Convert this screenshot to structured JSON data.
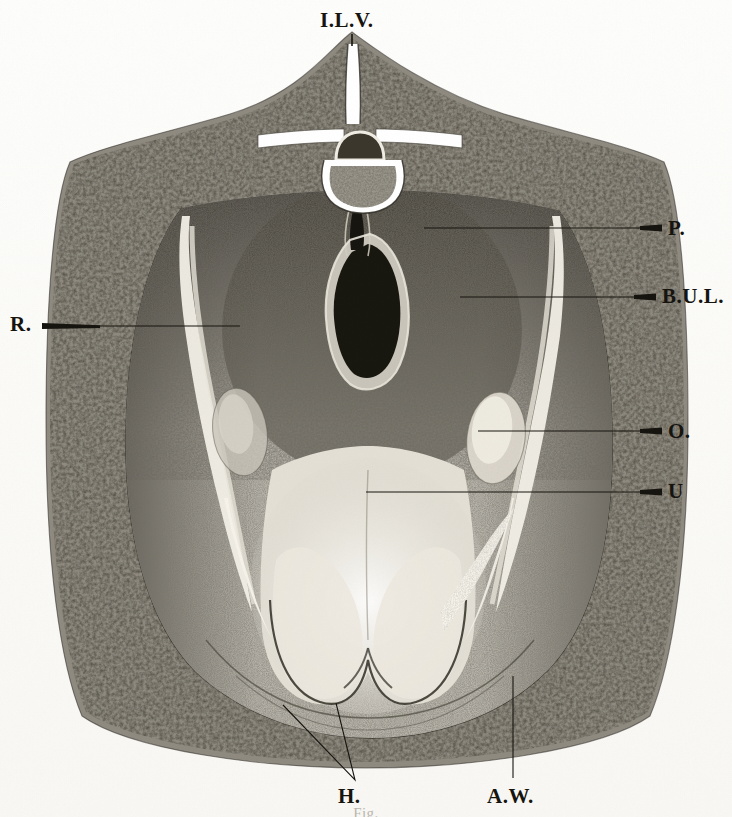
{
  "plate": {
    "title": "Transverse section of the female pelvis",
    "medium": "engraved halftone anatomical plate",
    "background_color": "#fdfdfb",
    "ink_color": "#16140f"
  },
  "labels": [
    {
      "key": "ILV",
      "text": "I.L.V.",
      "name": "label-ilv",
      "meaning": "intervertebral / lumbar vertebra",
      "x": 320,
      "y": 8,
      "size": "lg",
      "leader": {
        "type": "vertical",
        "x1": 352,
        "y1": 34,
        "x2": 352,
        "y2": 44
      }
    },
    {
      "key": "P",
      "text": "P.",
      "name": "label-p",
      "meaning": "peritoneum",
      "x": 668,
      "y": 216,
      "size": "lg",
      "leader": {
        "type": "horizontal",
        "x1": 424,
        "y1": 228,
        "x2": 662,
        "y2": 228
      }
    },
    {
      "key": "BUL",
      "text": "B.U.L.",
      "name": "label-bul",
      "meaning": "broad uterine ligament",
      "x": 662,
      "y": 284,
      "size": "lg",
      "leader": {
        "type": "horizontal",
        "x1": 460,
        "y1": 297,
        "x2": 656,
        "y2": 297
      }
    },
    {
      "key": "O",
      "text": "O.",
      "name": "label-o",
      "meaning": "ovary",
      "x": 668,
      "y": 419,
      "size": "lg",
      "leader": {
        "type": "horizontal",
        "x1": 478,
        "y1": 431,
        "x2": 662,
        "y2": 431
      }
    },
    {
      "key": "U",
      "text": "U",
      "name": "label-u",
      "meaning": "uterus",
      "x": 668,
      "y": 479,
      "size": "lg",
      "leader": {
        "type": "horizontal",
        "x1": 366,
        "y1": 492,
        "x2": 662,
        "y2": 492
      }
    },
    {
      "key": "R",
      "text": "R.",
      "name": "label-r",
      "meaning": "rectum",
      "x": 10,
      "y": 312,
      "size": "lg",
      "leader": {
        "type": "horizontal",
        "x1": 42,
        "y1": 326,
        "x2": 238,
        "y2": 326
      }
    },
    {
      "key": "H",
      "text": "H.",
      "name": "label-h",
      "meaning": "hip / head of femur",
      "x": 338,
      "y": 784,
      "size": "lg",
      "leader": {
        "type": "fork",
        "apex_x": 355,
        "apex_y": 780,
        "left_x": 283,
        "left_y": 705,
        "right_x": 336,
        "right_y": 703
      }
    },
    {
      "key": "AW",
      "text": "A.W.",
      "name": "label-aw",
      "meaning": "abdominal wall",
      "x": 487,
      "y": 784,
      "size": "lg",
      "leader": {
        "type": "vertical",
        "x1": 513,
        "y1": 676,
        "x2": 513,
        "y2": 778
      }
    }
  ],
  "caption_cut_off": "Fig.",
  "figure_parts": [
    {
      "name": "vertebra",
      "label_key": "ILV"
    },
    {
      "name": "spinal-canal",
      "label_key": "ILV"
    },
    {
      "name": "transverse-process-left",
      "label_key": "ILV"
    },
    {
      "name": "transverse-process-right",
      "label_key": "ILV"
    },
    {
      "name": "peritoneum-band",
      "label_key": "P"
    },
    {
      "name": "rectum-cavity",
      "label_key": "R"
    },
    {
      "name": "broad-ligament-left",
      "label_key": "BUL"
    },
    {
      "name": "broad-ligament-right",
      "label_key": "BUL"
    },
    {
      "name": "ovary-left",
      "label_key": "O"
    },
    {
      "name": "ovary-right",
      "label_key": "O"
    },
    {
      "name": "uterus-body",
      "label_key": "U"
    },
    {
      "name": "abdominal-wall-band",
      "label_key": "AW"
    },
    {
      "name": "hip-mass-left",
      "label_key": "H"
    },
    {
      "name": "hip-mass-right",
      "label_key": "H"
    }
  ]
}
